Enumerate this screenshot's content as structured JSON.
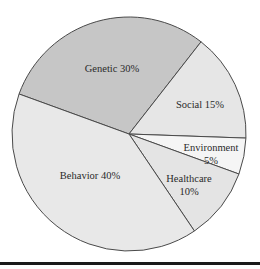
{
  "chart_data": {
    "type": "pie",
    "title": "",
    "categories": [
      "Genetic",
      "Social",
      "Environment",
      "Healthcare",
      "Behavior"
    ],
    "values": [
      30,
      15,
      5,
      10,
      40
    ],
    "unit": "%",
    "labels": [
      "Genetic 30%",
      "Social 15%",
      "Environment 5%",
      "Healthcare 10%",
      "Behavior 40%"
    ],
    "colors": [
      "#c6c6c6",
      "#e6e6e6",
      "#f5f5f5",
      "#e4e4e4",
      "#e8e8e8"
    ],
    "legend": "none (inline labels)",
    "start_angle_deg": 200,
    "direction": "clockwise"
  },
  "slices": [
    {
      "name": "Genetic",
      "line1": "Genetic 30%",
      "line2": ""
    },
    {
      "name": "Social",
      "line1": "Social 15%",
      "line2": ""
    },
    {
      "name": "Environment",
      "line1": "Environment",
      "line2": "5%"
    },
    {
      "name": "Healthcare",
      "line1": "Healthcare",
      "line2": "10%"
    },
    {
      "name": "Behavior",
      "line1": "Behavior 40%",
      "line2": ""
    }
  ]
}
